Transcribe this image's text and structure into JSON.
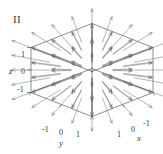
{
  "figure": {
    "panel_label": "II",
    "background_color": "#ffffff",
    "box_line_color": "#555555",
    "arrow_color": "#6f6f6f",
    "text_color": "#3a3a3a"
  },
  "axes": {
    "x": {
      "name": "x",
      "ticks": [
        "1",
        "0",
        "-1"
      ]
    },
    "y": {
      "name": "y",
      "ticks": [
        "-1",
        "0",
        "1"
      ]
    },
    "z": {
      "name": "z",
      "ticks": [
        "1",
        "0",
        "-1"
      ]
    }
  },
  "chart_data": {
    "type": "scatter",
    "title": "II",
    "plot_kind": "3d-vector-field",
    "field_formula": "F(x,y,z) = (x, y, z)",
    "projection": "oblique/axonometric cube",
    "xlabel": "x",
    "ylabel": "y",
    "zlabel": "z",
    "xlim": [
      -1,
      1
    ],
    "ylim": [
      -1,
      1
    ],
    "zlim": [
      -1,
      1
    ],
    "xticks": [
      1,
      0,
      -1
    ],
    "yticks": [
      -1,
      0,
      1
    ],
    "zticks": [
      1,
      0,
      -1
    ],
    "grid": false,
    "legend": false,
    "sample_grid": [
      -1,
      -0.5,
      0,
      0.5,
      1
    ],
    "vectors": [
      {
        "x": -1,
        "y": -1,
        "z": -1,
        "u": -1,
        "v": -1,
        "w": -1
      },
      {
        "x": -1,
        "y": -1,
        "z": 0,
        "u": -1,
        "v": -1,
        "w": 0
      },
      {
        "x": -1,
        "y": -1,
        "z": 1,
        "u": -1,
        "v": -1,
        "w": 1
      },
      {
        "x": -1,
        "y": 0,
        "z": -1,
        "u": -1,
        "v": 0,
        "w": -1
      },
      {
        "x": -1,
        "y": 0,
        "z": 0,
        "u": -1,
        "v": 0,
        "w": 0
      },
      {
        "x": -1,
        "y": 0,
        "z": 1,
        "u": -1,
        "v": 0,
        "w": 1
      },
      {
        "x": -1,
        "y": 1,
        "z": -1,
        "u": -1,
        "v": 1,
        "w": -1
      },
      {
        "x": -1,
        "y": 1,
        "z": 0,
        "u": -1,
        "v": 1,
        "w": 0
      },
      {
        "x": -1,
        "y": 1,
        "z": 1,
        "u": -1,
        "v": 1,
        "w": 1
      },
      {
        "x": 0,
        "y": -1,
        "z": -1,
        "u": 0,
        "v": -1,
        "w": -1
      },
      {
        "x": 0,
        "y": -1,
        "z": 0,
        "u": 0,
        "v": -1,
        "w": 0
      },
      {
        "x": 0,
        "y": -1,
        "z": 1,
        "u": 0,
        "v": -1,
        "w": 1
      },
      {
        "x": 0,
        "y": 0,
        "z": -1,
        "u": 0,
        "v": 0,
        "w": -1
      },
      {
        "x": 0,
        "y": 0,
        "z": 1,
        "u": 0,
        "v": 0,
        "w": 1
      },
      {
        "x": 0,
        "y": 1,
        "z": -1,
        "u": 0,
        "v": 1,
        "w": -1
      },
      {
        "x": 0,
        "y": 1,
        "z": 0,
        "u": 0,
        "v": 1,
        "w": 0
      },
      {
        "x": 0,
        "y": 1,
        "z": 1,
        "u": 0,
        "v": 1,
        "w": 1
      },
      {
        "x": 1,
        "y": -1,
        "z": -1,
        "u": 1,
        "v": -1,
        "w": -1
      },
      {
        "x": 1,
        "y": -1,
        "z": 0,
        "u": 1,
        "v": -1,
        "w": 0
      },
      {
        "x": 1,
        "y": -1,
        "z": 1,
        "u": 1,
        "v": -1,
        "w": 1
      },
      {
        "x": 1,
        "y": 0,
        "z": -1,
        "u": 1,
        "v": 0,
        "w": -1
      },
      {
        "x": 1,
        "y": 0,
        "z": 0,
        "u": 1,
        "v": 0,
        "w": 0
      },
      {
        "x": 1,
        "y": 0,
        "z": 1,
        "u": 1,
        "v": 0,
        "w": 1
      },
      {
        "x": 1,
        "y": 1,
        "z": -1,
        "u": 1,
        "v": 1,
        "w": -1
      },
      {
        "x": 1,
        "y": 1,
        "z": 0,
        "u": 1,
        "v": 1,
        "w": 0
      },
      {
        "x": 1,
        "y": 1,
        "z": 1,
        "u": 1,
        "v": 1,
        "w": 1
      }
    ]
  }
}
